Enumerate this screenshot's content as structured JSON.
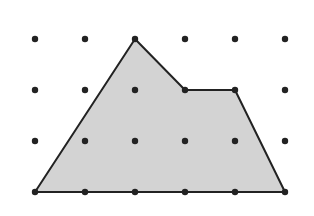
{
  "diagram": {
    "type": "polygon-on-dot-grid",
    "grid": {
      "columns": 6,
      "rows": 4,
      "origin_x": 35,
      "origin_y": 39,
      "spacing_x": 50,
      "spacing_y": 51,
      "dot_color": "#222222",
      "dot_radius": 3.2
    },
    "polygon": {
      "vertices_grid": [
        [
          2,
          0
        ],
        [
          3,
          1
        ],
        [
          4,
          1
        ],
        [
          5,
          3
        ],
        [
          0,
          3
        ]
      ],
      "fill": "#d3d3d3",
      "stroke": "#222222",
      "stroke_width": 2
    }
  }
}
